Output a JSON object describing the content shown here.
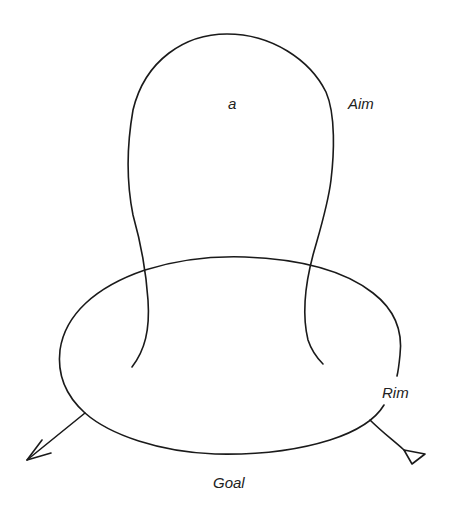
{
  "diagram": {
    "type": "topological-surface-sketch",
    "stroke_color": "#1a1a1a",
    "background": "#ffffff",
    "labels": {
      "inner": "a",
      "aim": "Aim",
      "rim": "Rim",
      "goal": "Goal"
    },
    "shapes": [
      {
        "name": "aim-loop",
        "description": "Tall rounded loop rising from the ellipse"
      },
      {
        "name": "rim-ellipse",
        "description": "Horizontal ellipse base, broken near Rim label"
      },
      {
        "name": "left-arrow",
        "description": "Line leaving ellipse lower-left with open arrowhead"
      },
      {
        "name": "right-tail",
        "description": "Line leaving ellipse lower-right ending in triangle"
      }
    ]
  }
}
